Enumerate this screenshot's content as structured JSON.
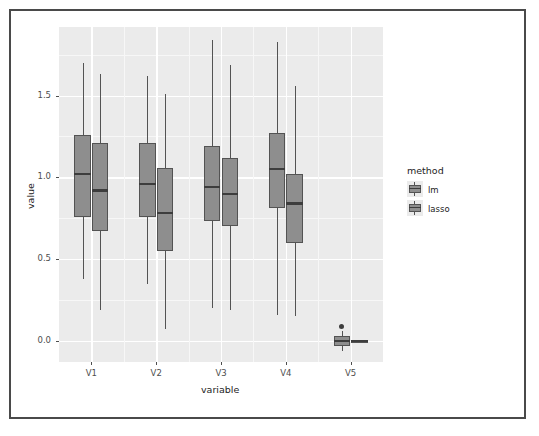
{
  "chart_data": {
    "type": "box",
    "title": "",
    "xlabel": "variable",
    "ylabel": "value",
    "categories": [
      "V1",
      "V2",
      "V3",
      "V4",
      "V5"
    ],
    "ytick_labels": [
      "0.0",
      "0.5",
      "1.0",
      "1.5"
    ],
    "ytick_values": [
      0.0,
      0.5,
      1.0,
      1.5
    ],
    "ylim": [
      -0.13,
      1.92
    ],
    "grid": true,
    "legend": {
      "title": "method",
      "position": "right",
      "entries": [
        {
          "label": "lm",
          "fill": "#8e8e8e"
        },
        {
          "label": "lasso",
          "fill": "#8e8e8e"
        }
      ]
    },
    "series": [
      {
        "name": "lm",
        "boxes": [
          {
            "category": "V1",
            "min": 0.38,
            "q1": 0.76,
            "median": 1.02,
            "q3": 1.26,
            "max": 1.7,
            "outliers": []
          },
          {
            "category": "V2",
            "min": 0.35,
            "q1": 0.76,
            "median": 0.96,
            "q3": 1.21,
            "max": 1.62,
            "outliers": []
          },
          {
            "category": "V3",
            "min": 0.2,
            "q1": 0.73,
            "median": 0.94,
            "q3": 1.19,
            "max": 1.84,
            "outliers": []
          },
          {
            "category": "V4",
            "min": 0.16,
            "q1": 0.81,
            "median": 1.05,
            "q3": 1.27,
            "max": 1.83,
            "outliers": []
          },
          {
            "category": "V5",
            "min": -0.06,
            "q1": -0.03,
            "median": 0.0,
            "q3": 0.03,
            "max": 0.06,
            "outliers": [
              0.09
            ]
          }
        ]
      },
      {
        "name": "lasso",
        "boxes": [
          {
            "category": "V1",
            "min": 0.19,
            "q1": 0.67,
            "median": 0.92,
            "q3": 1.21,
            "max": 1.63,
            "outliers": []
          },
          {
            "category": "V2",
            "min": 0.07,
            "q1": 0.55,
            "median": 0.78,
            "q3": 1.06,
            "max": 1.51,
            "outliers": []
          },
          {
            "category": "V3",
            "min": 0.19,
            "q1": 0.7,
            "median": 0.9,
            "q3": 1.12,
            "max": 1.69,
            "outliers": []
          },
          {
            "category": "V4",
            "min": 0.15,
            "q1": 0.6,
            "median": 0.84,
            "q3": 1.02,
            "max": 1.56,
            "outliers": []
          },
          {
            "category": "V5",
            "min": 0.0,
            "q1": 0.0,
            "median": 0.0,
            "q3": 0.0,
            "max": 0.0,
            "outliers": []
          }
        ]
      }
    ]
  }
}
